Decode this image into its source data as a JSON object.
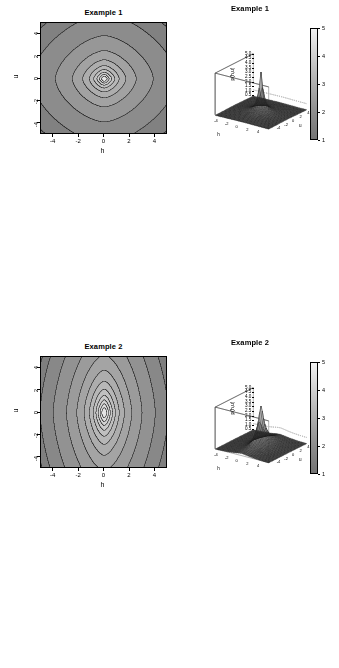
{
  "figure": {
    "background": "#ffffff",
    "rows": 4,
    "cols": 2,
    "width": 339,
    "height": 668
  },
  "panels": [
    {
      "index": 1,
      "title": "Example 1",
      "contour": {
        "xlabel": "h",
        "ylabel": "u",
        "xticks": [
          "-4",
          "-2",
          "0",
          "2",
          "4"
        ],
        "yticks": [
          "-4",
          "-2",
          "0",
          "2",
          "4"
        ],
        "xlim": [
          -5,
          5
        ],
        "ylim": [
          -5,
          5
        ],
        "shape": "diamond-saddle",
        "aniso_x": 1.0,
        "aniso_y": 1.0,
        "nlevels": 11,
        "bg": "#9a9a9a"
      },
      "persp": {
        "zlabel": "p(h,u)",
        "xlabel": "h",
        "ylabel": "u",
        "zticks": [
          "5.0",
          "4.5",
          "4.0",
          "3.5",
          "3.0",
          "2.5",
          "2.0",
          "1.5",
          "1.0",
          "0.5"
        ],
        "zlim": [
          0.4,
          5.0
        ],
        "xticks": [
          "-4",
          "-2",
          "0",
          "2",
          "4"
        ],
        "yticks": [
          "-4",
          "-2",
          "0",
          "2",
          "4"
        ],
        "aniso_x": 1.0,
        "aniso_y": 1.0
      },
      "colorbar": {
        "labels": [
          "5",
          "4",
          "3",
          "2",
          "1"
        ],
        "min": 1,
        "max": 5
      }
    },
    {
      "index": 2,
      "title": "Example 2",
      "contour": {
        "xlabel": "h",
        "ylabel": "u",
        "xticks": [
          "-4",
          "-2",
          "0",
          "2",
          "4"
        ],
        "yticks": [
          "-4",
          "-2",
          "0",
          "2",
          "4"
        ],
        "xlim": [
          -5,
          5
        ],
        "ylim": [
          -5,
          5
        ],
        "shape": "vertical-compressed-saddle",
        "aniso_x": 1.0,
        "aniso_y": 2.4,
        "nlevels": 13,
        "bg": "#9a9a9a"
      },
      "persp": {
        "zlabel": "p(h,u)",
        "xlabel": "h",
        "ylabel": "u",
        "zticks": [
          "5.0",
          "4.5",
          "4.0",
          "3.5",
          "3.0",
          "2.5",
          "2.0",
          "1.5",
          "1.0",
          "0.5"
        ],
        "zlim": [
          0.4,
          5.0
        ],
        "xticks": [
          "-4",
          "-2",
          "0",
          "2",
          "4"
        ],
        "yticks": [
          "-4",
          "-2",
          "0",
          "2",
          "4"
        ],
        "aniso_x": 1.0,
        "aniso_y": 2.4
      },
      "colorbar": {
        "labels": [
          "5",
          "4",
          "3",
          "2",
          "1"
        ],
        "min": 1,
        "max": 5
      }
    },
    {
      "index": 3,
      "title": "Example 3",
      "contour": {
        "xlabel": "h",
        "ylabel": "u",
        "xticks": [
          "-4",
          "-2",
          "0",
          "2",
          "4"
        ],
        "yticks": [
          "-4",
          "-2",
          "0",
          "2",
          "4"
        ],
        "xlim": [
          -5,
          5
        ],
        "ylim": [
          -5,
          5
        ],
        "shape": "horizontal-compressed-saddle",
        "aniso_x": 2.6,
        "aniso_y": 1.0,
        "nlevels": 11,
        "bg": "#9a9a9a"
      },
      "persp": {
        "zlabel": "p(h,u)",
        "xlabel": "h",
        "ylabel": "u",
        "zticks": [
          "5.0",
          "4.5",
          "4.0",
          "3.5",
          "3.0",
          "2.5",
          "2.0",
          "1.5",
          "1.0",
          "0.5"
        ],
        "zlim": [
          0.4,
          5.0
        ],
        "xticks": [
          "-4",
          "-2",
          "0",
          "2",
          "4"
        ],
        "yticks": [
          "-4",
          "-2",
          "0",
          "2",
          "4"
        ],
        "aniso_x": 2.6,
        "aniso_y": 1.0
      },
      "colorbar": {
        "labels": [
          "5",
          "4",
          "3",
          "2",
          "1"
        ],
        "min": 1,
        "max": 5
      }
    },
    {
      "index": 4,
      "title": "Example 4",
      "contour": {
        "xlabel": "h",
        "ylabel": "u",
        "xticks": [
          "-4",
          "-2",
          "0",
          "2",
          "4"
        ],
        "yticks": [
          "-4",
          "-2",
          "0",
          "2",
          "4"
        ],
        "xlim": [
          -5,
          5
        ],
        "ylim": [
          -5,
          5
        ],
        "shape": "strongly-horizontal-layered",
        "aniso_x": 4.2,
        "aniso_y": 1.0,
        "nlevels": 22,
        "bg": "#9a9a9a"
      },
      "persp": {
        "zlabel": "p(h,u)",
        "xlabel": "h",
        "ylabel": "u",
        "zticks": [
          "3.0",
          "2.8",
          "2.6",
          "2.4",
          "2.2",
          "2.0",
          "1.8",
          "1.6",
          "1.4",
          "1.2",
          "1.0",
          "0.8",
          "0.6",
          "0.4"
        ],
        "zlim": [
          0.4,
          3.0
        ],
        "xticks": [
          "-4",
          "-2",
          "0",
          "2",
          "4"
        ],
        "yticks": [
          "-4",
          "-2",
          "0",
          "2",
          "4"
        ],
        "aniso_x": 4.2,
        "aniso_y": 1.0
      },
      "colorbar": {
        "labels": [
          "3.0",
          "2.5",
          "2.0",
          "1.5",
          "1.0",
          "0.5"
        ],
        "min": 0.4,
        "max": 3.0
      }
    }
  ]
}
